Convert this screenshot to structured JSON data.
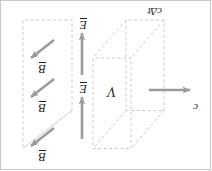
{
  "figure": {
    "orientation_degrees": 180,
    "colors": {
      "dashed_line": "#c9c9c9",
      "arrow": "#9a9a9a",
      "text": "#1c1c1c",
      "background": "#ffffff",
      "border": "#c8c8c8"
    },
    "labels": {
      "speed": "c",
      "volume": "V",
      "length": "cΔt",
      "field_e_top": "E",
      "field_e_bottom": "E",
      "field_b_top": "B",
      "field_b_middle": "B",
      "field_b_bottom": "B"
    },
    "vectors": [
      {
        "name": "speed-arrow",
        "label": "c",
        "direction": "left",
        "vector_notation": false
      },
      {
        "name": "e-arrow-upper",
        "label": "E",
        "direction": "down",
        "vector_notation": true
      },
      {
        "name": "e-arrow-lower",
        "label": "E",
        "direction": "down",
        "vector_notation": true
      },
      {
        "name": "b-arrow-top",
        "label": "B",
        "direction": "up-right",
        "vector_notation": true
      },
      {
        "name": "b-arrow-mid",
        "label": "B",
        "direction": "up-right",
        "vector_notation": true
      },
      {
        "name": "b-arrow-bot",
        "label": "B",
        "direction": "up-right",
        "vector_notation": true
      }
    ],
    "shapes": [
      {
        "name": "volume-box",
        "style": "dashed",
        "kind": "3d-rectangular-box"
      },
      {
        "name": "wavefront-plane",
        "style": "dashed",
        "kind": "parallelogram"
      }
    ]
  }
}
